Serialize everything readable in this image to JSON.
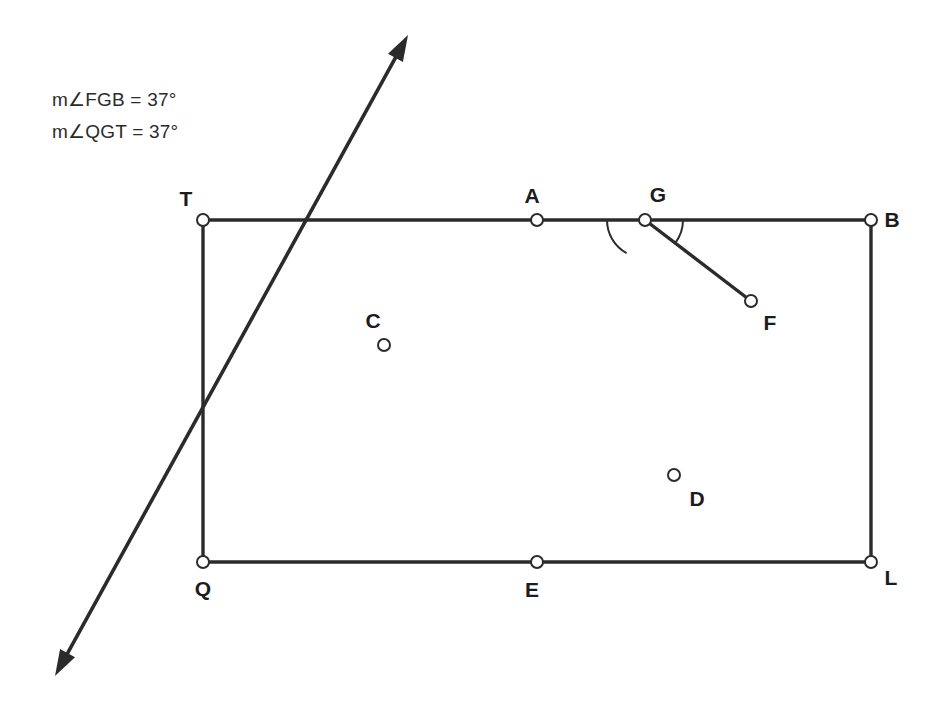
{
  "figure": {
    "colors": {
      "stroke": "#2b2b2b",
      "background": "#ffffff",
      "label": "#1c1c1c",
      "vertex_fill": "#ffffff"
    },
    "annotations": [
      {
        "id": "angle-fgb",
        "text": "m∠FGB = 37°",
        "x": 52,
        "y": 88
      },
      {
        "id": "angle-qgt",
        "text": "m∠QGT = 37°",
        "x": 52,
        "y": 120
      }
    ],
    "angle_measures": {
      "FGB": "37°",
      "QGT": "37°"
    },
    "points": [
      {
        "name": "T",
        "x": 203,
        "y": 220,
        "label_x": 186,
        "label_y": 199,
        "marker": true
      },
      {
        "name": "A",
        "x": 537,
        "y": 220,
        "label_x": 532,
        "label_y": 196,
        "marker": true
      },
      {
        "name": "G",
        "x": 645,
        "y": 220,
        "label_x": 658,
        "label_y": 195,
        "marker": true
      },
      {
        "name": "B",
        "x": 871,
        "y": 220,
        "label_x": 892,
        "label_y": 220,
        "marker": true
      },
      {
        "name": "C",
        "x": 384,
        "y": 345,
        "label_x": 373,
        "label_y": 321,
        "marker": true
      },
      {
        "name": "F",
        "x": 751,
        "y": 301,
        "label_x": 770,
        "label_y": 323,
        "marker": true
      },
      {
        "name": "D",
        "x": 674,
        "y": 475,
        "label_x": 697,
        "label_y": 499,
        "marker": true
      },
      {
        "name": "Q",
        "x": 203,
        "y": 562,
        "label_x": 203,
        "label_y": 589,
        "marker": true
      },
      {
        "name": "E",
        "x": 537,
        "y": 562,
        "label_x": 532,
        "label_y": 590,
        "marker": true
      },
      {
        "name": "L",
        "x": 871,
        "y": 562,
        "label_x": 891,
        "label_y": 578,
        "marker": true
      }
    ],
    "segments": [
      {
        "id": "segment-TB",
        "from": "T",
        "to": "B",
        "x1": 203,
        "y1": 220,
        "x2": 871,
        "y2": 220
      },
      {
        "id": "segment-QL",
        "from": "Q",
        "to": "L",
        "x1": 203,
        "y1": 562,
        "x2": 871,
        "y2": 562
      },
      {
        "id": "segment-TQ",
        "from": "T",
        "to": "Q",
        "x1": 203,
        "y1": 220,
        "x2": 203,
        "y2": 562
      },
      {
        "id": "segment-BL",
        "from": "B",
        "to": "L",
        "x1": 871,
        "y1": 220,
        "x2": 871,
        "y2": 562
      },
      {
        "id": "segment-GF",
        "from": "G",
        "to": "F",
        "x1": 645,
        "y1": 220,
        "x2": 751,
        "y2": 301
      }
    ],
    "rays": [
      {
        "id": "ray-through-Q-and-G",
        "description": "double-headed ray passing through Q and G",
        "x1": 55,
        "y1": 676,
        "x2": 408,
        "y2": 35,
        "arrow_start": true,
        "arrow_end": true
      }
    ],
    "angle_arcs": [
      {
        "id": "arc-QGT",
        "vertex": "G",
        "radius": 38,
        "start_deg": 180,
        "end_deg": 241
      },
      {
        "id": "arc-FGB",
        "vertex": "G",
        "radius": 38,
        "start_deg": 0,
        "end_deg": -37
      }
    ]
  }
}
